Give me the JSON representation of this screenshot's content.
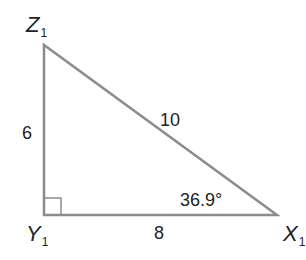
{
  "diagram": {
    "type": "right-triangle",
    "vertices": [
      {
        "id": "Z",
        "letter": "Z",
        "subscript": "1",
        "x": 44,
        "y": 45
      },
      {
        "id": "Y",
        "letter": "Y",
        "subscript": "1",
        "x": 44,
        "y": 215
      },
      {
        "id": "X",
        "letter": "X",
        "subscript": "1",
        "x": 277,
        "y": 215
      }
    ],
    "sides": {
      "ZY": "6",
      "YX": "8",
      "ZX": "10"
    },
    "angle_label": "36.9°",
    "right_angle_at": "Y",
    "colors": {
      "line": "#8c8c8c",
      "text": "#222222"
    }
  }
}
